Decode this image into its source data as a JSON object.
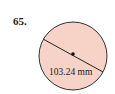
{
  "problem": {
    "number": "65."
  },
  "figure": {
    "shape": "circle",
    "fill_color": "#f7d3c7",
    "stroke_color": "#333333",
    "dimension_label": "103.24 mm",
    "dimension_type": "diameter"
  }
}
